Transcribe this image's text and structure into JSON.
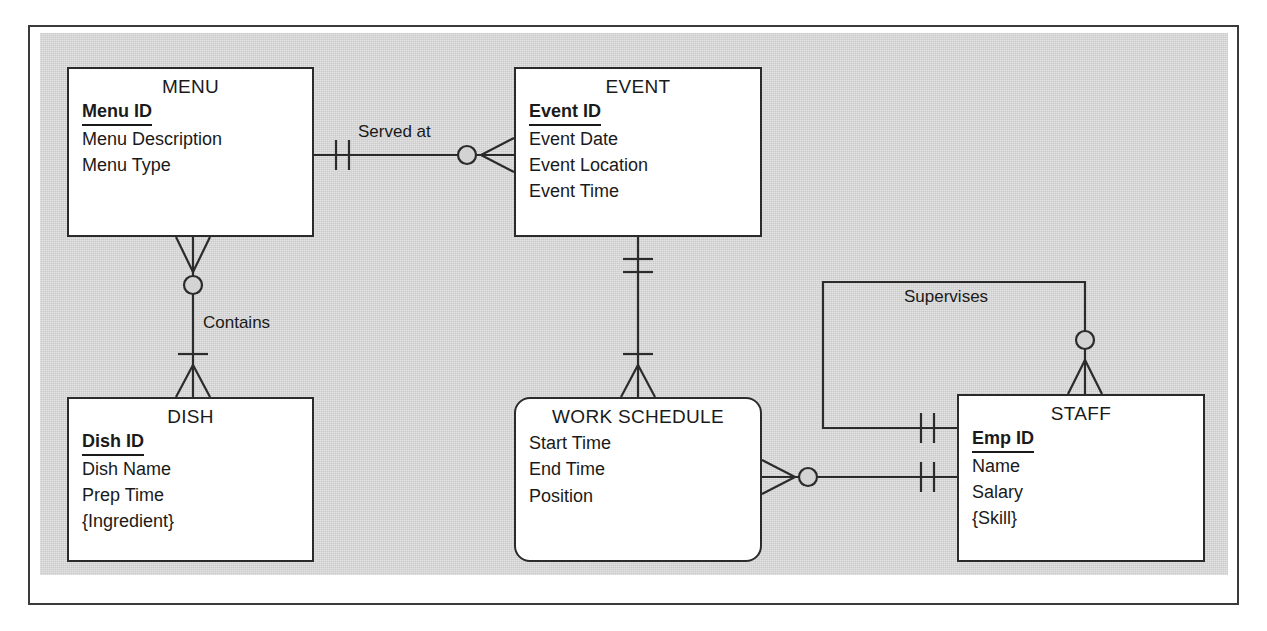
{
  "diagram": {
    "type": "crows-foot-er-diagram",
    "canvas_color": "#d3d3d3",
    "entity_fill": "#ffffff",
    "line_color": "#2b2b2b",
    "entities": [
      {
        "id": "menu",
        "name": "MENU",
        "weak": false,
        "key": "Menu ID",
        "attributes": [
          "Menu Description",
          "Menu Type"
        ]
      },
      {
        "id": "event",
        "name": "EVENT",
        "weak": false,
        "key": "Event ID",
        "attributes": [
          "Event Date",
          "Event Location",
          "Event Time"
        ]
      },
      {
        "id": "dish",
        "name": "DISH",
        "weak": false,
        "key": "Dish ID",
        "attributes": [
          "Dish Name",
          "Prep Time",
          "{Ingredient}"
        ]
      },
      {
        "id": "work_schedule",
        "name": "WORK SCHEDULE",
        "weak": true,
        "key": "",
        "attributes": [
          "Start Time",
          "End Time",
          "Position"
        ]
      },
      {
        "id": "staff",
        "name": "STAFF",
        "weak": false,
        "key": "Emp ID",
        "attributes": [
          "Name",
          "Salary",
          "{Skill}"
        ]
      }
    ],
    "relationships": [
      {
        "id": "served_at",
        "label": "Served at",
        "from": "menu",
        "to": "event",
        "from_cardinality": "one-and-only-one",
        "to_cardinality": "zero-or-many"
      },
      {
        "id": "contains",
        "label": "Contains",
        "from": "menu",
        "to": "dish",
        "from_cardinality": "zero-or-many",
        "to_cardinality": "one-or-many"
      },
      {
        "id": "event_schedule",
        "label": "",
        "from": "event",
        "to": "work_schedule",
        "from_cardinality": "one-and-only-one",
        "to_cardinality": "one-or-many"
      },
      {
        "id": "schedule_staff",
        "label": "",
        "from": "work_schedule",
        "to": "staff",
        "from_cardinality": "zero-or-many",
        "to_cardinality": "one-and-only-one"
      },
      {
        "id": "supervises",
        "label": "Supervises",
        "from": "staff",
        "to": "staff",
        "from_cardinality": "zero-or-many",
        "to_cardinality": "one-and-only-one"
      }
    ]
  }
}
